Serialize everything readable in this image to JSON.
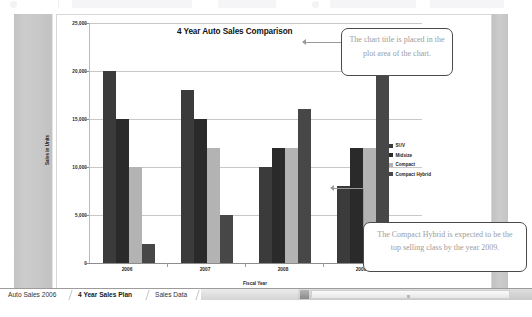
{
  "window": {
    "toolbar_visible": true
  },
  "chart_data": {
    "type": "bar",
    "title": "4 Year Auto Sales Comparison",
    "xlabel": "Fiscal Year",
    "ylabel": "Sales in Units",
    "categories": [
      "2006",
      "2007",
      "2008",
      "2009"
    ],
    "ylim": [
      0,
      25000
    ],
    "yticks": [
      0,
      5000,
      10000,
      15000,
      20000,
      25000
    ],
    "ytick_labels": [
      "0",
      "5,000",
      "10,000",
      "15,000",
      "20,000",
      "25,000"
    ],
    "grid": true,
    "legend_position": "right",
    "series": [
      {
        "name": "SUV",
        "color": "#3b3b3b",
        "values": [
          20000,
          18000,
          10000,
          8000
        ]
      },
      {
        "name": "Midsize",
        "color": "#2a2a2a",
        "values": [
          15000,
          15000,
          12000,
          12000
        ]
      },
      {
        "name": "Compact",
        "color": "#b3b3b3",
        "values": [
          10000,
          12000,
          12000,
          12000
        ]
      },
      {
        "name": "Compact Hybrid",
        "color": "#474747",
        "values": [
          2000,
          5000,
          16000,
          23500
        ]
      }
    ]
  },
  "callouts": [
    {
      "id": "chart-title-callout",
      "text": "The chart title is placed in the plot area of the chart."
    },
    {
      "id": "hybrid-callout",
      "text": "The Compact Hybrid is expected to be the top selling class by the year 2009."
    }
  ],
  "sheet_tabs": {
    "items": [
      {
        "label": "Auto Sales 2006",
        "active": false
      },
      {
        "label": "4 Year Sales Plan",
        "active": true
      },
      {
        "label": "Sales Data",
        "active": false
      }
    ]
  },
  "scrollbar": {
    "orientation": "horizontal",
    "left_button_icon": "triangle-left-icon"
  }
}
